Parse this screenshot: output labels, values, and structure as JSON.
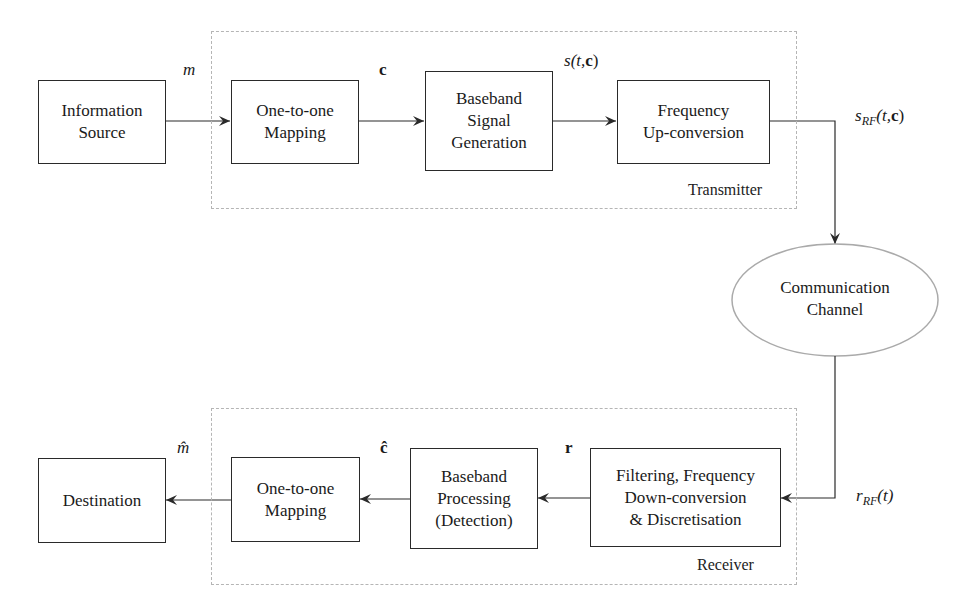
{
  "diagram": {
    "type": "block-diagram",
    "transmitter": {
      "label": "Transmitter",
      "blocks": [
        {
          "id": "info_source",
          "label": "Information\nSource"
        },
        {
          "id": "tx_mapping",
          "label": "One-to-one\nMapping"
        },
        {
          "id": "baseband_gen",
          "label": "Baseband\nSignal\nGeneration"
        },
        {
          "id": "freq_up",
          "label": "Frequency\nUp-conversion"
        }
      ]
    },
    "channel": {
      "label": "Communication\nChannel"
    },
    "receiver": {
      "label": "Receiver",
      "blocks": [
        {
          "id": "filtering",
          "label": "Filtering, Frequency\nDown-conversion\n& Discretisation"
        },
        {
          "id": "baseband_proc",
          "label": "Baseband\nProcessing\n(Detection)"
        },
        {
          "id": "rx_mapping",
          "label": "One-to-one\nMapping"
        },
        {
          "id": "destination",
          "label": "Destination"
        }
      ]
    },
    "signals": {
      "m": {
        "main": "m"
      },
      "c": {
        "main": "c"
      },
      "s": {
        "main": "s",
        "args": "(t,",
        "bold": "c",
        "close": ")"
      },
      "s_rf": {
        "main": "s",
        "sub": "RF",
        "args": "(t,",
        "bold": "c",
        "close": ")"
      },
      "r_rf": {
        "main": "r",
        "sub": "RF",
        "args": "(t)"
      },
      "r": {
        "main": "r"
      },
      "c_hat": {
        "main": "ĉ"
      },
      "m_hat": {
        "main": "m̂"
      }
    },
    "colors": {
      "line": "#2a2a2a",
      "dashed": "#b5b5b5",
      "ellipse": "#aaaaaa"
    }
  }
}
